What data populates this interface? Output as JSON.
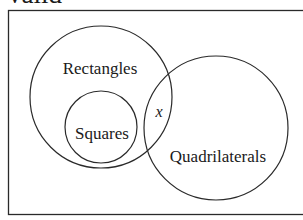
{
  "header": {
    "cropped_text": "valid"
  },
  "diagram": {
    "type": "venn",
    "stroke_color": "#2a2a2a",
    "frame": {
      "x": 8,
      "y": 10,
      "width": 300,
      "height": 204
    },
    "sets": [
      {
        "name": "rectangles",
        "label": "Rectangles",
        "cx": 101,
        "cy": 97,
        "r": 71
      },
      {
        "name": "squares",
        "label": "Squares",
        "cx": 101,
        "cy": 127,
        "r": 36
      },
      {
        "name": "quadrilaterals",
        "label": "Quadrilaterals",
        "cx": 216,
        "cy": 128,
        "r": 72
      }
    ],
    "region_marker": {
      "label": "x"
    }
  }
}
